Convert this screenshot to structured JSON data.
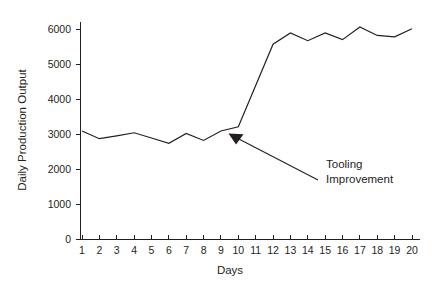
{
  "chart_data": {
    "type": "line",
    "title": "",
    "xlabel": "Days",
    "ylabel": "Daily Production Output",
    "x": [
      1,
      2,
      3,
      4,
      5,
      6,
      7,
      8,
      9,
      10,
      11,
      12,
      13,
      14,
      15,
      16,
      17,
      18,
      19,
      20
    ],
    "xtick_labels": [
      "1",
      "2",
      "3",
      "4",
      "5",
      "6",
      "7",
      "8",
      "9",
      "10",
      "11",
      "12",
      "13",
      "14",
      "15",
      "16",
      "17",
      "18",
      "19",
      "20"
    ],
    "values": [
      3100,
      2880,
      2960,
      3050,
      2900,
      2750,
      3030,
      2830,
      3100,
      3220,
      4400,
      5580,
      5900,
      5680,
      5900,
      5710,
      6070,
      5830,
      5790,
      6020
    ],
    "ylim": [
      0,
      6300
    ],
    "xlim": [
      1,
      20
    ],
    "ytick_values": [
      0,
      1000,
      2000,
      3000,
      4000,
      5000,
      6000
    ],
    "ytick_labels": [
      "0",
      "1000",
      "2000",
      "3000",
      "4000",
      "5000",
      "6000"
    ],
    "grid": false,
    "legend": "none",
    "line_color": "#231f20",
    "annotations": [
      {
        "text_line1": "Tooling",
        "text_line2": "Improvement",
        "points_to_x": 10,
        "points_to_y": 3000
      }
    ]
  },
  "colors": {
    "axis": "#231f20",
    "series": "#231f20",
    "background": "#ffffff"
  }
}
